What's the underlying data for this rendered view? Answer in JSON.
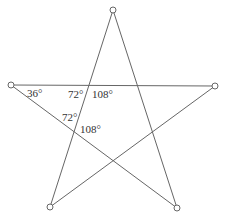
{
  "diagram": {
    "type": "pentagram",
    "stroke_color": "#666666",
    "vertices": [
      {
        "name": "top",
        "x": 113,
        "y": 10
      },
      {
        "name": "right",
        "x": 215,
        "y": 86
      },
      {
        "name": "bottom-right",
        "x": 177,
        "y": 208
      },
      {
        "name": "bottom-left",
        "x": 50,
        "y": 207
      },
      {
        "name": "left",
        "x": 11,
        "y": 85
      }
    ],
    "angle_labels": [
      {
        "id": "a1",
        "text": "36°",
        "x": 27,
        "y": 97
      },
      {
        "id": "a2",
        "text": "72°",
        "x": 68,
        "y": 98
      },
      {
        "id": "a3",
        "text": "108°",
        "x": 92,
        "y": 98
      },
      {
        "id": "a4",
        "text": "72°",
        "x": 62,
        "y": 121
      },
      {
        "id": "a5",
        "text": "108°",
        "x": 80,
        "y": 133
      }
    ]
  }
}
